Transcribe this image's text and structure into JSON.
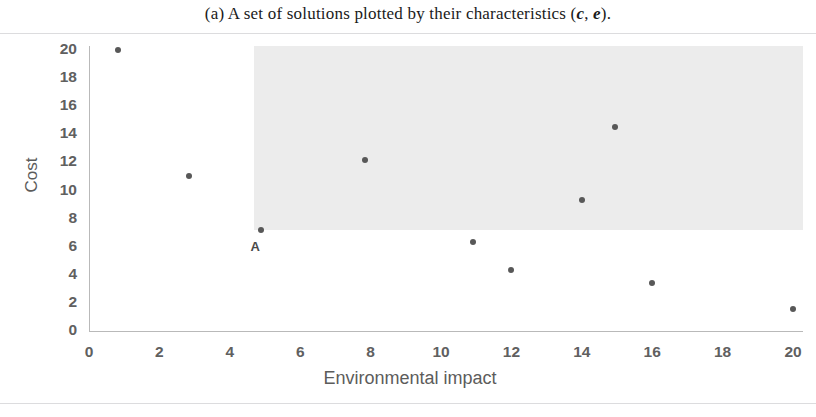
{
  "caption": {
    "prefix": "(a) A set of solutions plotted by their characteristics (",
    "var1": "c",
    "separator": ", ",
    "var2": "e",
    "suffix": ")."
  },
  "chart_data": {
    "type": "scatter",
    "title": "",
    "xlabel": "Environmental impact",
    "ylabel": "Cost",
    "xlim": [
      0,
      20
    ],
    "ylim": [
      0,
      20
    ],
    "xticks": [
      "0",
      "2",
      "4",
      "6",
      "8",
      "10",
      "12",
      "14",
      "16",
      "18",
      "20"
    ],
    "yticks": [
      "0",
      "2",
      "4",
      "6",
      "8",
      "10",
      "12",
      "14",
      "16",
      "18",
      "20"
    ],
    "grid": false,
    "legend": "none",
    "points": [
      {
        "x": 0.83,
        "y": 20.0,
        "label": ""
      },
      {
        "x": 2.85,
        "y": 11.0,
        "label": ""
      },
      {
        "x": 4.9,
        "y": 7.2,
        "label": "A"
      },
      {
        "x": 7.85,
        "y": 12.2,
        "label": ""
      },
      {
        "x": 10.9,
        "y": 6.3,
        "label": ""
      },
      {
        "x": 12.0,
        "y": 4.35,
        "label": ""
      },
      {
        "x": 14.0,
        "y": 9.3,
        "label": ""
      },
      {
        "x": 14.95,
        "y": 14.5,
        "label": ""
      },
      {
        "x": 16.0,
        "y": 3.4,
        "label": ""
      },
      {
        "x": 20.0,
        "y": 1.6,
        "label": ""
      }
    ],
    "annotations": [
      {
        "name": "dominated-region",
        "kind": "rectangle",
        "x0": 4.7,
        "y0": 7.2,
        "x1": 20.3,
        "y1": 20.5,
        "fill": "#e9e9e9"
      }
    ],
    "colors": {
      "point": "#585858",
      "axis": "#b9b9b9",
      "tick_label": "#60605f",
      "axis_title": "#5c5c5b",
      "region_fill": "#e9e9e9"
    }
  }
}
